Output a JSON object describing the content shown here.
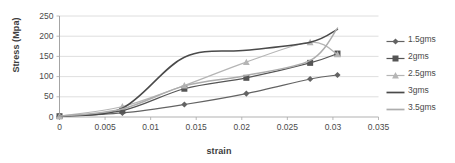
{
  "chart_data": {
    "type": "line",
    "title": "",
    "xlabel": "strain",
    "ylabel": "Stress (Mpa)",
    "xlim": [
      0,
      0.035
    ],
    "ylim": [
      0,
      250
    ],
    "grid": "horizontal",
    "legend_position": "right",
    "x_ticks": [
      "0",
      "0.005",
      "0.01",
      "0.015",
      "0.02",
      "0.025",
      "0.03",
      "0.035"
    ],
    "x_tick_values": [
      0,
      0.005,
      0.01,
      0.015,
      0.02,
      0.025,
      0.03,
      0.035
    ],
    "y_ticks": [
      "0",
      "50",
      "100",
      "150",
      "200",
      "250"
    ],
    "y_tick_values": [
      0,
      50,
      100,
      150,
      200,
      250
    ],
    "series": [
      {
        "name": "1.5gms",
        "color": "#636363",
        "marker": "diamond",
        "x": [
          0,
          0.0069,
          0.0137,
          0.0205,
          0.0275,
          0.0305
        ],
        "values": [
          2,
          10,
          31,
          58,
          94,
          104
        ]
      },
      {
        "name": "2gms",
        "color": "#555555",
        "marker": "square",
        "x": [
          0,
          0.0069,
          0.0137,
          0.0205,
          0.0275,
          0.0305
        ],
        "values": [
          2,
          16,
          70,
          97,
          134,
          157
        ]
      },
      {
        "name": "2.5gms",
        "color": "#b5b5b5",
        "marker": "triangle",
        "x": [
          0,
          0.0069,
          0.0137,
          0.0205,
          0.0275,
          0.0305
        ],
        "values": [
          2,
          26,
          78,
          136,
          185,
          155
        ]
      },
      {
        "name": "3gms",
        "color": "#4a4a4a",
        "marker": "none",
        "x": [
          0,
          0.0069,
          0.0137,
          0.0205,
          0.0275,
          0.0305
        ],
        "values": [
          2,
          22,
          148,
          165,
          185,
          217
        ]
      },
      {
        "name": "3.5gms",
        "color": "#adadad",
        "marker": "none",
        "x": [
          0,
          0.0069,
          0.0137,
          0.0205,
          0.0275,
          0.0305
        ],
        "values": [
          2,
          20,
          77,
          103,
          140,
          220
        ]
      }
    ]
  }
}
